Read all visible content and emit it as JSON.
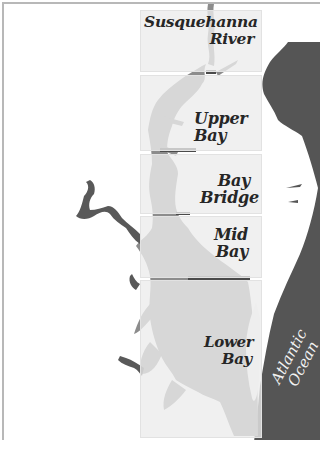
{
  "map": {
    "title": "Chesapeake Bay segments",
    "colors": {
      "land": "#ffffff",
      "bay_water": "#8c8c8c",
      "tributary_water_outside": "#595959",
      "ocean": "#555555",
      "panel_fill": "#ececec",
      "segment_divider": "#4a4a4a",
      "label_text": "#262626",
      "ocean_label_text": "#f2f2f2"
    },
    "segments": [
      {
        "id": "susquehanna-river",
        "label_line1": "Susquehanna",
        "label_line2": "River"
      },
      {
        "id": "upper-bay",
        "label_line1": "Upper",
        "label_line2": "Bay"
      },
      {
        "id": "bay-bridge",
        "label_line1": "Bay",
        "label_line2": "Bridge"
      },
      {
        "id": "mid-bay",
        "label_line1": "Mid",
        "label_line2": "Bay"
      },
      {
        "id": "lower-bay",
        "label_line1": "Lower",
        "label_line2": "Bay"
      }
    ],
    "ocean_label": {
      "line1": "Atlantic",
      "line2": "Ocean"
    }
  },
  "footer": {
    "credit": ""
  }
}
